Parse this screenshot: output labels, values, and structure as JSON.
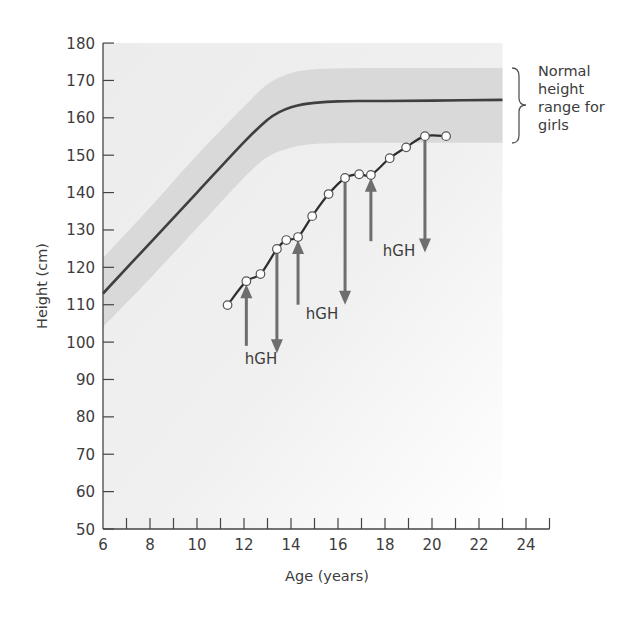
{
  "chart_data": {
    "type": "line",
    "title": "",
    "xlabel": "Age (years)",
    "ylabel": "Height (cm)",
    "xlim": [
      6,
      25
    ],
    "ylim": [
      50,
      180
    ],
    "x_ticks": [
      6,
      8,
      10,
      12,
      14,
      16,
      18,
      20,
      22,
      24
    ],
    "y_ticks": [
      50,
      60,
      70,
      80,
      90,
      100,
      110,
      120,
      130,
      140,
      150,
      160,
      170,
      180
    ],
    "grid": false,
    "series": [
      {
        "name": "Average height (girls)",
        "style": "solid dark line",
        "x": [
          6,
          8,
          10,
          12,
          13,
          13.5,
          14,
          14.5,
          15,
          16,
          17,
          18,
          20,
          23
        ],
        "y": [
          113,
          126.5,
          140,
          153.5,
          159.5,
          161.5,
          162.8,
          163.6,
          164.0,
          164.4,
          164.5,
          164.5,
          164.6,
          164.8
        ]
      },
      {
        "name": "Normal height range for girls (upper)",
        "style": "shaded band upper edge",
        "x": [
          6,
          8,
          10,
          12,
          13,
          14,
          15,
          16,
          18,
          23
        ],
        "y": [
          122.5,
          136,
          150,
          163,
          169,
          172,
          173,
          173.2,
          173.3,
          173.3
        ]
      },
      {
        "name": "Normal height range for girls (lower)",
        "style": "shaded band lower edge",
        "x": [
          6,
          8,
          10,
          12,
          13,
          14,
          15,
          16,
          18,
          23
        ],
        "y": [
          104,
          117,
          130.5,
          144,
          149.5,
          152,
          153,
          153.2,
          153.3,
          153.3
        ]
      },
      {
        "name": "Patient height",
        "style": "line with open circle markers",
        "x": [
          11.3,
          12.1,
          12.7,
          13.4,
          13.8,
          14.3,
          14.9,
          15.6,
          16.3,
          16.9,
          17.4,
          18.2,
          18.9,
          19.7,
          20.6
        ],
        "y": [
          109.9,
          116.3,
          118.2,
          124.9,
          127.3,
          128.1,
          133.7,
          139.6,
          143.9,
          144.9,
          144.7,
          149.2,
          152.1,
          155.1,
          155.1
        ]
      }
    ],
    "annotations": [
      {
        "type": "arrow-up",
        "label": "hGH start",
        "x": 12.1,
        "from_y": 99,
        "to_y": 115.5
      },
      {
        "type": "arrow-down",
        "label": "hGH stop",
        "x": 13.4,
        "from_y": 124.5,
        "to_y": 97
      },
      {
        "type": "arrow-up",
        "label": "hGH start",
        "x": 14.3,
        "from_y": 110,
        "to_y": 127.3
      },
      {
        "type": "arrow-down",
        "label": "hGH stop",
        "x": 16.3,
        "from_y": 143.5,
        "to_y": 110
      },
      {
        "type": "arrow-up",
        "label": "hGH start",
        "x": 17.4,
        "from_y": 127,
        "to_y": 144
      },
      {
        "type": "arrow-down",
        "label": "hGH stop",
        "x": 19.7,
        "from_y": 154.5,
        "to_y": 124
      }
    ],
    "text_labels": [
      {
        "text": "hGH",
        "x": 12.7,
        "y": 95
      },
      {
        "text": "hGH",
        "x": 15.2,
        "y": 107
      },
      {
        "text": "hGH",
        "x": 18.4,
        "y": 124
      }
    ],
    "legend": {
      "text": "Normal height range for girls",
      "position": "right",
      "marker": "brace"
    }
  },
  "labels": {
    "x_axis_title": "Age (years)",
    "y_axis_title": "Height (cm)",
    "hgh_1": "hGH",
    "hgh_2": "hGH",
    "hgh_3": "hGH",
    "legend_line1": "Normal",
    "legend_line2": "height",
    "legend_line3": "range for",
    "legend_line4": "girls"
  },
  "colors": {
    "band": "#d9d9d9",
    "plot_background": "#efefef",
    "average_line": "#3f3f3f",
    "patient_line": "#2e2e2e",
    "arrow": "#6e6e6e",
    "marker_fill": "#ffffff"
  }
}
